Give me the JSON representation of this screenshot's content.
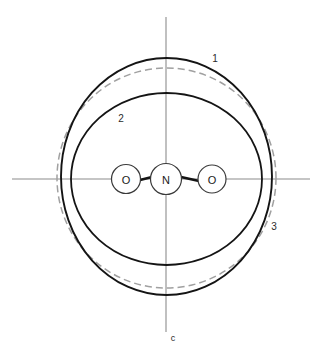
{
  "figure": {
    "type": "molecular-orbital-contour-diagram",
    "background_color": "#ffffff",
    "width": 323,
    "height": 355,
    "origin": {
      "x": 166,
      "y": 179
    }
  },
  "axes": {
    "horizontal": {
      "name": "horizontal-axis",
      "x1": 12,
      "y1": 179,
      "x2": 310,
      "y2": 179,
      "color": "#8c8c8c",
      "label": ""
    },
    "vertical": {
      "name": "vertical-axis",
      "x1": 166,
      "y1": 17,
      "x2": 166,
      "y2": 332,
      "color": "#8c8c8c",
      "label": "c",
      "label_x": 173,
      "label_y": 338
    }
  },
  "molecule": {
    "formula": "ONO",
    "bond_color": "#141414",
    "atoms": [
      {
        "label": "O",
        "cx": 126,
        "cy": 179,
        "r": 14.5,
        "name": "atom-oxygen-left"
      },
      {
        "label": "N",
        "cx": 166,
        "cy": 179,
        "r": 15.5,
        "name": "atom-nitrogen-center"
      },
      {
        "label": "O",
        "cx": 212,
        "cy": 179,
        "r": 14.0,
        "name": "atom-oxygen-right"
      }
    ],
    "bonds": [
      {
        "x1": 140,
        "y1": 180,
        "x2": 151,
        "y2": 177,
        "name": "bond-left"
      },
      {
        "x1": 182,
        "y1": 177,
        "x2": 198,
        "y2": 181,
        "name": "bond-right"
      }
    ]
  },
  "contours": [
    {
      "id": "1",
      "name": "contour-outer-solid",
      "style": "solid",
      "color": "#141414",
      "cx": 166.5,
      "cy": 176.5,
      "rx": 105.5,
      "ry": 118.5,
      "label": "1",
      "label_x": 215,
      "label_y": 58
    },
    {
      "id": "2",
      "name": "contour-inner-solid",
      "style": "solid",
      "color": "#141414",
      "cx": 166.5,
      "cy": 179,
      "rx": 95.5,
      "ry": 86,
      "label": "2",
      "label_x": 121,
      "label_y": 118
    },
    {
      "id": "3",
      "name": "contour-dashed",
      "style": "dashed",
      "color": "#a0a0a0",
      "cx": 166.5,
      "cy": 178,
      "rx": 109.5,
      "ry": 110,
      "label": "3",
      "label_x": 274,
      "label_y": 226
    }
  ]
}
